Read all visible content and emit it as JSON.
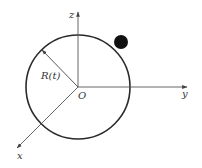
{
  "diagram": {
    "colors": {
      "line": "#2a2a2a",
      "axis": "#555555",
      "ball": "#111111",
      "background": "#ffffff"
    },
    "origin": {
      "label": "O",
      "x": 78,
      "y": 87
    },
    "sphere": {
      "cx": 78,
      "cy": 87,
      "r": 52
    },
    "radius_label": "R(t)",
    "axes": [
      {
        "name": "z",
        "label": "z",
        "x2": 78,
        "y2": 12
      },
      {
        "name": "y",
        "label": "y",
        "x2": 187,
        "y2": 87
      },
      {
        "name": "x",
        "label": "x",
        "x2": 17,
        "y2": 148
      }
    ],
    "particle": {
      "cx": 121,
      "cy": 42,
      "r": 7
    }
  }
}
